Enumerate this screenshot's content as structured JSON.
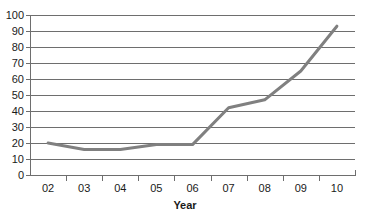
{
  "chart_data": {
    "type": "line",
    "title": "",
    "xlabel": "Year",
    "ylabel": "",
    "categories": [
      "02",
      "03",
      "04",
      "05",
      "06",
      "07",
      "08",
      "09",
      "10"
    ],
    "values": [
      20,
      16,
      16,
      19,
      19,
      42,
      47,
      65,
      93
    ],
    "series": [
      {
        "name": "",
        "values": [
          20,
          16,
          16,
          19,
          19,
          42,
          47,
          65,
          93
        ],
        "color": "#808080"
      }
    ],
    "ylim": [
      0,
      100
    ],
    "ytick_step": 10,
    "yticks": [
      0,
      10,
      20,
      30,
      40,
      50,
      60,
      70,
      80,
      90,
      100
    ],
    "ytick_labels": [
      "0",
      "10",
      "20",
      "30",
      "40",
      "50",
      "60",
      "70",
      "80",
      "90",
      "100"
    ],
    "grid": true,
    "grid_axis": "y",
    "grid_color": "#6e6e6e",
    "legend": false,
    "legend_position": "none",
    "markers": false,
    "line_width": 3,
    "background": "#ffffff",
    "axis_color": "#6e6e6e",
    "text_color": "#1a1a1a"
  }
}
